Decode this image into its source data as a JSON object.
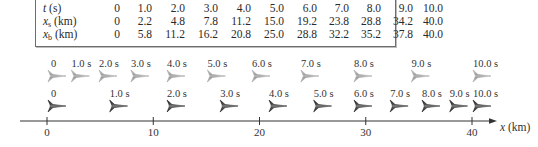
{
  "table": {
    "rows": [
      {
        "label_main": "t",
        "label_sub": "",
        "label_unit": " (s)",
        "values": [
          "0",
          "1.0",
          "2.0",
          "3.0",
          "4.0",
          "5.0",
          "6.0",
          "7.0",
          "8.0",
          "9.0",
          "10.0"
        ]
      },
      {
        "label_main": "x",
        "label_sub": "s",
        "label_unit": " (km)",
        "values": [
          "0",
          "2.2",
          "4.8",
          "7.8",
          "11.2",
          "15.0",
          "19.2",
          "23.8",
          "28.8",
          "34.2",
          "40.0"
        ]
      },
      {
        "label_main": "x",
        "label_sub": "b",
        "label_unit": " (km)",
        "values": [
          "0",
          "5.8",
          "11.2",
          "16.2",
          "20.8",
          "25.0",
          "28.8",
          "32.2",
          "35.2",
          "37.8",
          "40.0"
        ]
      }
    ]
  },
  "chart_data": {
    "type": "scatter",
    "title": "",
    "xlabel": "x (km)",
    "ylabel": "",
    "xlim": [
      0,
      40
    ],
    "x_ticks": [
      0,
      10,
      20,
      30,
      40
    ],
    "x_tick_labels": [
      "0",
      "10",
      "20",
      "30",
      "40"
    ],
    "times": [
      "0",
      "1.0 s",
      "2.0 s",
      "3.0 s",
      "4.0 s",
      "5.0 s",
      "6.0 s",
      "7.0 s",
      "8.0 s",
      "9.0 s",
      "10.0 s"
    ],
    "series": [
      {
        "name": "x_s",
        "row": "top",
        "color": "#a8a8a8",
        "values": [
          0,
          2.2,
          4.8,
          7.8,
          11.2,
          15.0,
          19.2,
          23.8,
          28.8,
          34.2,
          40.0
        ]
      },
      {
        "name": "x_b",
        "row": "bottom",
        "color": "#2b2b2b",
        "values": [
          0,
          5.8,
          11.2,
          16.2,
          20.8,
          25.0,
          28.8,
          32.2,
          35.2,
          37.8,
          40.0
        ]
      }
    ]
  }
}
